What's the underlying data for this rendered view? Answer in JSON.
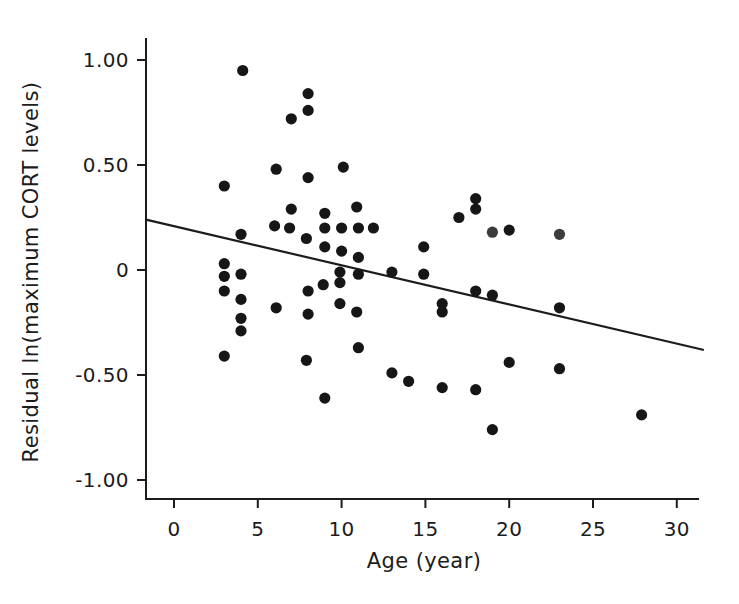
{
  "figure": {
    "background": "#ffffff",
    "ink_color": "#1c1c1c",
    "dot_color": "#161616",
    "muted_dot_color": "#3c3c3c",
    "trend_color": "#1c1c1c"
  },
  "chart_data": {
    "type": "scatter",
    "title": "",
    "xlabel": "Age (year)",
    "ylabel": "Residual ln(maximum CORT levels)",
    "xlim": [
      -1.7,
      31.6
    ],
    "ylim": [
      -1.1,
      1.1
    ],
    "grid": false,
    "legend": null,
    "x_ticks": [
      0,
      5,
      10,
      15,
      20,
      25,
      30
    ],
    "x_tick_labels": [
      "0",
      "5",
      "10",
      "15",
      "20",
      "25",
      "30"
    ],
    "y_ticks": [
      1.0,
      0.5,
      0,
      -0.5,
      -1.0
    ],
    "y_tick_labels": [
      "1.00",
      "0.50",
      "0",
      "-0.50",
      "-1.00"
    ],
    "trend_line": {
      "x1": -1.67,
      "y1": 0.24,
      "x2": 31.56,
      "y2": -0.38
    },
    "points": [
      [
        3,
        0.4
      ],
      [
        3,
        0.03
      ],
      [
        3,
        -0.03
      ],
      [
        3,
        -0.1
      ],
      [
        3,
        -0.41
      ],
      [
        4.1,
        0.95
      ],
      [
        4,
        0.17
      ],
      [
        4,
        -0.02
      ],
      [
        4,
        -0.14
      ],
      [
        4,
        -0.23
      ],
      [
        4,
        -0.29
      ],
      [
        6,
        0.21
      ],
      [
        6.1,
        0.48
      ],
      [
        6.1,
        -0.18
      ],
      [
        7,
        0.72
      ],
      [
        7,
        0.29
      ],
      [
        6.9,
        0.2
      ],
      [
        8,
        0.84
      ],
      [
        8,
        0.76
      ],
      [
        8,
        0.44
      ],
      [
        7.9,
        0.15
      ],
      [
        8,
        -0.1
      ],
      [
        8,
        -0.21
      ],
      [
        7.9,
        -0.43
      ],
      [
        9,
        0.27
      ],
      [
        9,
        0.2
      ],
      [
        9,
        0.11
      ],
      [
        8.9,
        -0.07
      ],
      [
        9,
        -0.61
      ],
      [
        10.1,
        0.49
      ],
      [
        10,
        0.2
      ],
      [
        10,
        0.09
      ],
      [
        9.9,
        -0.01
      ],
      [
        9.9,
        -0.06
      ],
      [
        9.9,
        -0.16
      ],
      [
        10.9,
        0.3
      ],
      [
        11,
        0.2
      ],
      [
        11,
        0.06
      ],
      [
        11,
        -0.02
      ],
      [
        10.9,
        -0.2
      ],
      [
        11,
        -0.37
      ],
      [
        11.9,
        0.2
      ],
      [
        13,
        -0.01
      ],
      [
        13,
        -0.49
      ],
      [
        14,
        -0.53
      ],
      [
        14.9,
        0.11
      ],
      [
        14.9,
        -0.02
      ],
      [
        16,
        -0.16
      ],
      [
        16,
        -0.2
      ],
      [
        16,
        -0.56
      ],
      [
        17,
        0.25
      ],
      [
        18,
        0.34
      ],
      [
        18,
        0.29
      ],
      [
        18,
        -0.1
      ],
      [
        18,
        -0.57
      ],
      [
        19,
        0.18,
        "muted"
      ],
      [
        19,
        -0.12
      ],
      [
        19,
        -0.76
      ],
      [
        20,
        0.19
      ],
      [
        20,
        -0.44
      ],
      [
        23,
        0.17,
        "muted"
      ],
      [
        23,
        -0.18
      ],
      [
        23,
        -0.47
      ],
      [
        27.9,
        -0.69
      ]
    ]
  }
}
